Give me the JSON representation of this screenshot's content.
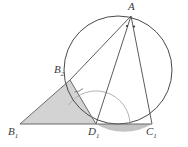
{
  "figure": {
    "width": 188,
    "height": 147,
    "background_color": "#ffffff",
    "stroke_color": "#4a4a4a",
    "shade_color": "#d3d3d3",
    "segment_shade_color": "#b9b9b9"
  },
  "points": {
    "A": {
      "label": "A",
      "sub": "",
      "x": 131,
      "y": 16,
      "label_x": 128,
      "label_y": 1
    },
    "B2": {
      "label": "B",
      "sub": "2",
      "x": 70,
      "y": 80,
      "label_x": 54,
      "label_y": 64
    },
    "B1": {
      "label": "B",
      "sub": "1",
      "x": 20,
      "y": 124,
      "label_x": 8,
      "label_y": 126
    },
    "D1": {
      "label": "D",
      "sub": "1",
      "x": 96,
      "y": 124,
      "label_x": 88,
      "label_y": 126
    },
    "C1": {
      "label": "C",
      "sub": "1",
      "x": 152,
      "y": 124,
      "label_x": 146,
      "label_y": 126
    }
  },
  "circle": {
    "center_x": 118,
    "center_y": 70,
    "radius": 54
  },
  "segments": [
    {
      "name": "chord-a-b2",
      "from": "A",
      "to": "B2"
    },
    {
      "name": "chord-a-d1",
      "from": "A",
      "to": "D1"
    },
    {
      "name": "chord-a-c1",
      "from": "A",
      "to": "C1"
    },
    {
      "name": "side-b1-b2",
      "from": "B1",
      "to": "B2"
    },
    {
      "name": "side-b2-d1",
      "from": "B2",
      "to": "D1"
    },
    {
      "name": "base-b1-c1",
      "from": "B1",
      "to": "C1"
    }
  ],
  "shaded_regions": [
    {
      "name": "triangle-b1-b2-d1",
      "vertices": [
        "B1",
        "B2",
        "D1"
      ]
    },
    {
      "name": "circular-segment-d1-c1"
    }
  ],
  "angle_marks": {
    "vertex_a_dots": 2,
    "arc_at_b2": true,
    "arc_at_d1": true
  }
}
